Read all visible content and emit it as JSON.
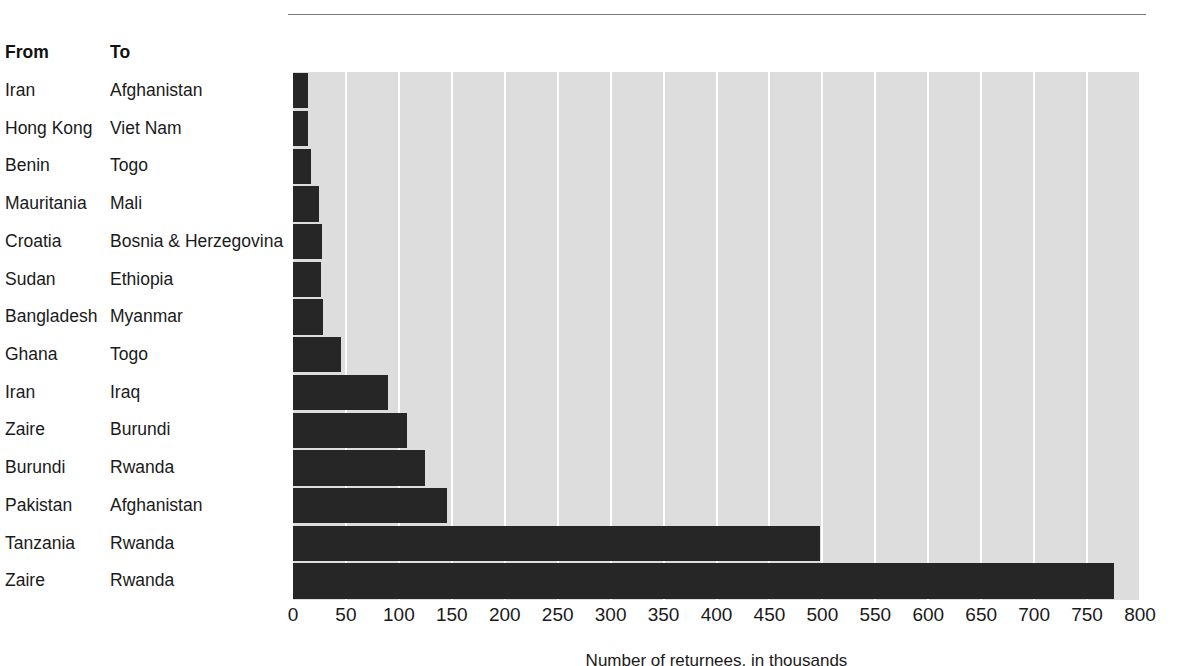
{
  "columns": {
    "from_header": "From",
    "to_header": "To"
  },
  "axis_title": "Number of returnees, in thousands",
  "colors": {
    "bar": "#262626",
    "plot_background": "#dddddd",
    "gridline": "#ffffff",
    "rule": "#7a7a7a",
    "text": "#1a1a1a"
  },
  "chart_data": {
    "type": "bar",
    "orientation": "horizontal",
    "title": "",
    "xlabel": "Number of returnees, in thousands",
    "ylabel": "",
    "xlim": [
      0,
      800
    ],
    "xticks": [
      0,
      50,
      100,
      150,
      200,
      250,
      300,
      350,
      400,
      450,
      500,
      550,
      600,
      650,
      700,
      750,
      800
    ],
    "grid": "vertical",
    "legend": "none",
    "categories": [
      "Iran → Afghanistan",
      "Hong Kong → Viet Nam",
      "Benin → Togo",
      "Mauritania → Mali",
      "Croatia → Bosnia & Herzegovina",
      "Sudan → Ethiopia",
      "Bangladesh → Myanmar",
      "Ghana → Togo",
      "Iran → Iraq",
      "Zaire → Burundi",
      "Burundi → Rwanda",
      "Pakistan → Afghanistan",
      "Tanzania → Rwanda",
      "Zaire → Rwanda"
    ],
    "values": [
      14,
      14,
      17,
      25,
      27,
      26,
      28,
      45,
      90,
      108,
      125,
      145,
      498,
      775
    ]
  },
  "rows": [
    {
      "from": "Iran",
      "to": "Afghanistan",
      "value": 14
    },
    {
      "from": "Hong Kong",
      "to": "Viet Nam",
      "value": 14
    },
    {
      "from": "Benin",
      "to": "Togo",
      "value": 17
    },
    {
      "from": "Mauritania",
      "to": "Mali",
      "value": 25
    },
    {
      "from": "Croatia",
      "to": "Bosnia & Herzegovina",
      "value": 27
    },
    {
      "from": "Sudan",
      "to": "Ethiopia",
      "value": 26
    },
    {
      "from": "Bangladesh",
      "to": "Myanmar",
      "value": 28
    },
    {
      "from": "Ghana",
      "to": "Togo",
      "value": 45
    },
    {
      "from": "Iran",
      "to": "Iraq",
      "value": 90
    },
    {
      "from": "Zaire",
      "to": "Burundi",
      "value": 108
    },
    {
      "from": "Burundi",
      "to": "Rwanda",
      "value": 125
    },
    {
      "from": "Pakistan",
      "to": "Afghanistan",
      "value": 145
    },
    {
      "from": "Tanzania",
      "to": "Rwanda",
      "value": 498
    },
    {
      "from": "Zaire",
      "to": "Rwanda",
      "value": 775
    }
  ]
}
